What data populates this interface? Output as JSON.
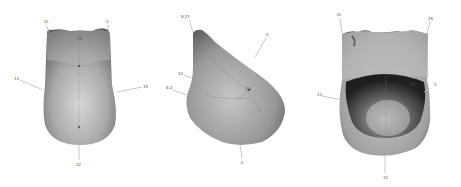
{
  "figure": {
    "background": "#ffffff",
    "views": [
      {
        "id": "anterior",
        "labels": [
          {
            "text": "2L",
            "x": 44,
            "y": 23
          },
          {
            "text": "2",
            "x": 108,
            "y": 23
          },
          {
            "text": "2S",
            "x": 78,
            "y": 40
          },
          {
            "text": "14",
            "x": 16,
            "y": 79
          },
          {
            "text": "15",
            "x": 144,
            "y": 86
          },
          {
            "text": "12",
            "x": 78,
            "y": 165
          }
        ]
      },
      {
        "id": "lateral",
        "labels": [
          {
            "text": "8.2Y",
            "x": 184,
            "y": 17
          },
          {
            "text": "2",
            "x": 267,
            "y": 36
          },
          {
            "text": "10",
            "x": 180,
            "y": 75
          },
          {
            "text": "8.2",
            "x": 168,
            "y": 88
          },
          {
            "text": "16",
            "x": 246,
            "y": 93
          },
          {
            "text": "2",
            "x": 242,
            "y": 163
          }
        ]
      },
      {
        "id": "posterior",
        "labels": [
          {
            "text": "2L",
            "x": 339,
            "y": 16
          },
          {
            "text": "2S",
            "x": 430,
            "y": 20
          },
          {
            "text": "13",
            "x": 319,
            "y": 94
          },
          {
            "text": "14",
            "x": 412,
            "y": 85
          },
          {
            "text": "2",
            "x": 436,
            "y": 86
          },
          {
            "text": "12",
            "x": 384,
            "y": 178
          }
        ]
      }
    ]
  }
}
